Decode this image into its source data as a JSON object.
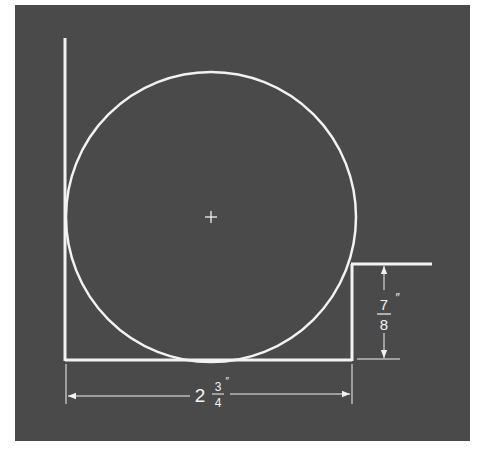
{
  "figure": {
    "background_color": "#4a4a4a",
    "line_color": "#f2f2f2",
    "circle": {
      "center_mark": "+",
      "cx": 211,
      "cy": 217,
      "r": 145
    },
    "dimensions": {
      "height": {
        "whole": "",
        "numerator": "7",
        "denominator": "8",
        "unit": "″",
        "label": "7/8″"
      },
      "width": {
        "whole": "2",
        "numerator": "3",
        "denominator": "4",
        "unit": "″",
        "label": "2 3/4″"
      }
    }
  }
}
